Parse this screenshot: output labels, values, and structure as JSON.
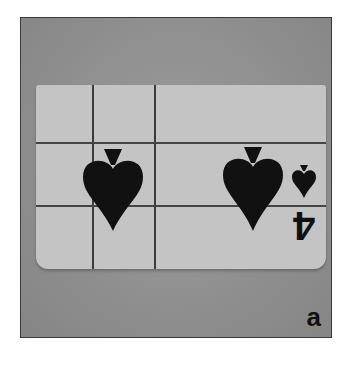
{
  "figure": {
    "panel_label": "a",
    "card": {
      "rank": "4",
      "suit": "spades",
      "orientation": "inverted"
    }
  },
  "colors": {
    "frame_background": "#8f8f8f",
    "card_face": "#c4c4c4",
    "ink": "#111111",
    "grid_lines": "#3c3c3c"
  }
}
